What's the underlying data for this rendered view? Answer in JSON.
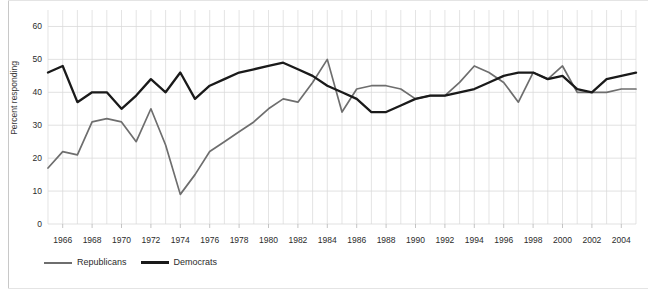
{
  "chart_data": {
    "type": "line",
    "title": "",
    "xlabel": "",
    "ylabel": "Percent responding",
    "xlim": [
      1965,
      2005
    ],
    "ylim": [
      0,
      65
    ],
    "yticks": [
      0,
      10,
      20,
      30,
      40,
      50,
      60
    ],
    "xticks": [
      1966,
      1968,
      1970,
      1972,
      1974,
      1976,
      1978,
      1980,
      1982,
      1984,
      1986,
      1988,
      1990,
      1992,
      1994,
      1996,
      1998,
      2000,
      2002,
      2004
    ],
    "grid": true,
    "legend_position": "bottom-left",
    "x": [
      1965,
      1966,
      1967,
      1968,
      1969,
      1970,
      1971,
      1972,
      1973,
      1974,
      1975,
      1976,
      1977,
      1978,
      1979,
      1980,
      1981,
      1982,
      1983,
      1984,
      1985,
      1986,
      1987,
      1988,
      1989,
      1990,
      1991,
      1992,
      1993,
      1994,
      1995,
      1996,
      1997,
      1998,
      1999,
      2000,
      2001,
      2002,
      2003,
      2004,
      2005
    ],
    "series": [
      {
        "name": "Republicans",
        "color": "#6e6e6e",
        "values": [
          17,
          22,
          21,
          31,
          32,
          31,
          25,
          35,
          24,
          9,
          15,
          22,
          25,
          28,
          31,
          35,
          38,
          37,
          43,
          50,
          34,
          41,
          42,
          42,
          41,
          38,
          39,
          39,
          43,
          48,
          46,
          43,
          37,
          46,
          44,
          48,
          40,
          40,
          40,
          41,
          41
        ]
      },
      {
        "name": "Democrats",
        "color": "#1a1a1a",
        "values": [
          46,
          48,
          37,
          40,
          40,
          35,
          39,
          44,
          40,
          46,
          38,
          42,
          44,
          46,
          47,
          48,
          49,
          47,
          45,
          42,
          40,
          38,
          34,
          34,
          36,
          38,
          39,
          39,
          40,
          41,
          43,
          45,
          46,
          46,
          44,
          45,
          41,
          40,
          44,
          45,
          46
        ]
      }
    ]
  },
  "axes": {
    "ytick_labels": [
      "60",
      "50",
      "40",
      "30",
      "20",
      "10",
      "0"
    ],
    "xtick_labels": [
      "1966",
      "1968",
      "1970",
      "1972",
      "1974",
      "1976",
      "1978",
      "1980",
      "1982",
      "1984",
      "1986",
      "1988",
      "1990",
      "1992",
      "1994",
      "1996",
      "1998",
      "2000",
      "2002",
      "2004"
    ],
    "ylabel": "Percent responding"
  },
  "legend": {
    "items": [
      {
        "label": "Republicans",
        "color": "#6e6e6e"
      },
      {
        "label": "Democrats",
        "color": "#1a1a1a"
      }
    ]
  },
  "colors": {
    "republicans": "#6e6e6e",
    "democrats": "#1a1a1a",
    "grid": "#d9d9d9",
    "background": "#ffffff"
  }
}
